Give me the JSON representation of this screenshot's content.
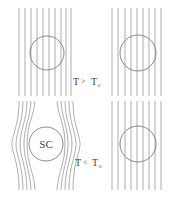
{
  "diagram": {
    "colors": {
      "field_line": "#9a9a9a",
      "sample_outline": "#7a7a7a",
      "text": "#444444",
      "background": "#ffffff"
    },
    "panels": [
      {
        "id": "top-left",
        "condition": "T > Tc",
        "field": "penetrates",
        "sample_label": "",
        "circle": {
          "cx": 47,
          "cy": 53,
          "r": 17
        },
        "line_count": 10
      },
      {
        "id": "top-right",
        "field": "penetrates",
        "sample_label": "",
        "circle": {
          "cx": 138,
          "cy": 53,
          "r": 18
        },
        "line_count": 9
      },
      {
        "id": "bottom-left",
        "condition": "T < Tc",
        "field": "expelled",
        "sample_label": "SC",
        "circle": {
          "cx": 46,
          "cy": 144,
          "r": 17
        },
        "line_count": 10
      },
      {
        "id": "bottom-right",
        "field": "penetrates",
        "sample_label": "",
        "circle": {
          "cx": 138,
          "cy": 144,
          "r": 18
        },
        "line_count": 9
      }
    ],
    "labels": {
      "above": {
        "T": "T",
        "op": ">",
        "Tc_main": "T",
        "Tc_sub": "c"
      },
      "below": {
        "T": "T",
        "op": "<",
        "Tc_main": "T",
        "Tc_sub": "c"
      },
      "sc": "SC"
    }
  }
}
